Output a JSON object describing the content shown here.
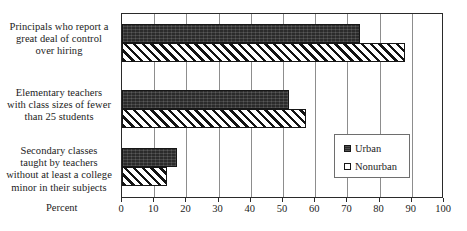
{
  "chart_data": {
    "type": "bar",
    "orientation": "horizontal",
    "title": "",
    "xlabel": "Percent",
    "ylabel": "",
    "xlim": [
      0,
      100
    ],
    "xticks": [
      0,
      10,
      20,
      30,
      40,
      50,
      60,
      70,
      80,
      90,
      100
    ],
    "grid": true,
    "legend_position": "inside-right-lower",
    "categories": [
      "Principals who report a great deal of control over hiring",
      "Elementary teachers with class sizes of fewer than 25 students",
      "Secondary classes taught by teachers without at least a college minor in their subjects"
    ],
    "category_label_lines": [
      [
        "Principals who report a",
        "great deal of control",
        "over hiring"
      ],
      [
        "Elementary teachers",
        "with class sizes of fewer",
        "than 25 students"
      ],
      [
        "Secondary classes",
        "taught by teachers",
        "without at least a college",
        "minor in their subjects"
      ]
    ],
    "series": [
      {
        "name": "Urban",
        "values": [
          74,
          52,
          17
        ],
        "color": "#2b2b2b",
        "pattern": "solid-dark"
      },
      {
        "name": "Nonurban",
        "values": [
          88,
          57,
          14
        ],
        "color": "#ffffff",
        "pattern": "diagonal-hatch"
      }
    ]
  },
  "axis": {
    "tick_labels": [
      "0",
      "10",
      "20",
      "30",
      "40",
      "50",
      "60",
      "70",
      "80",
      "90",
      "100"
    ],
    "x_title": "Percent"
  },
  "legend": {
    "items": [
      {
        "label": "Urban",
        "swatch": "filled-dark-square"
      },
      {
        "label": "Nonurban",
        "swatch": "hollow-square"
      }
    ]
  },
  "colors": {
    "urban": "#2b2b2b",
    "nonurban": "#ffffff",
    "hatch": "#131313",
    "axis": "#2a2a2a",
    "gridline": "#8d8d8d",
    "text": "#1b1b1b",
    "background": "#ffffff"
  }
}
